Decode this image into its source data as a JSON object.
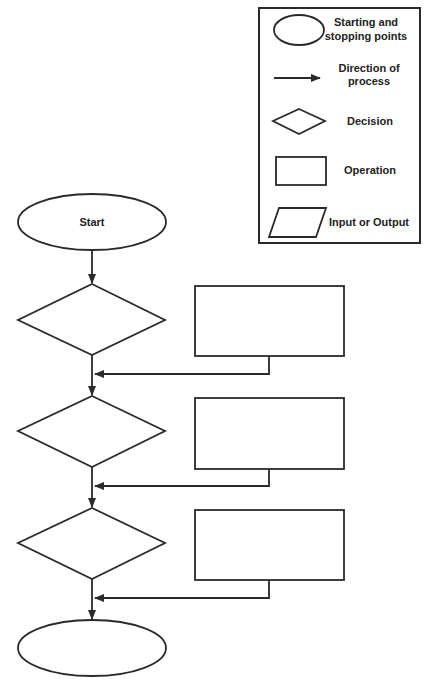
{
  "legend": {
    "items": [
      {
        "shape": "ellipse",
        "label_lines": [
          "Starting and",
          "stopping points"
        ]
      },
      {
        "shape": "arrow",
        "label_lines": [
          "Direction of",
          "process"
        ]
      },
      {
        "shape": "diamond",
        "label_lines": [
          "Decision"
        ]
      },
      {
        "shape": "rectangle",
        "label_lines": [
          "Operation"
        ]
      },
      {
        "shape": "parallelogram",
        "label_lines": [
          "Input or Output"
        ]
      }
    ]
  },
  "flowchart": {
    "start_label": "Start",
    "end_label": "",
    "decisions": [
      "",
      "",
      ""
    ],
    "operations": [
      "",
      "",
      ""
    ]
  },
  "colors": {
    "stroke": "#2a2a2a",
    "background": "#ffffff",
    "text": "#222222"
  }
}
